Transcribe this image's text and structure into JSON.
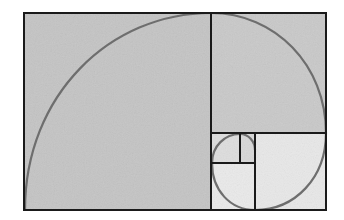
{
  "diagram": {
    "colors": {
      "background": "#ffffff",
      "large_fill": "#c4c4c4",
      "medium_fill": "#c9c9c9",
      "small_fill": "#d6d6d6",
      "light_fill": "#e4e4e4",
      "lightest_fill": "#eaeaea",
      "border": "#1a1a1a",
      "spiral": "#6e6e6e"
    },
    "outer_rect": {
      "x": 24,
      "y": 13,
      "w": 302,
      "h": 197
    },
    "squares": [
      {
        "name": "square-1",
        "x": 24,
        "y": 13,
        "w": 187,
        "h": 197
      },
      {
        "name": "square-2",
        "x": 211,
        "y": 13,
        "w": 115,
        "h": 120
      },
      {
        "name": "square-3",
        "x": 255,
        "y": 133,
        "w": 71,
        "h": 77
      },
      {
        "name": "square-4",
        "x": 211,
        "y": 163,
        "w": 44,
        "h": 47
      },
      {
        "name": "square-5",
        "x": 211,
        "y": 133,
        "w": 29,
        "h": 30
      },
      {
        "name": "square-6",
        "x": 240,
        "y": 133,
        "w": 15,
        "h": 30
      }
    ]
  }
}
